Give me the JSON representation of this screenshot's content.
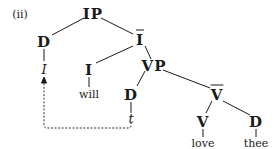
{
  "example_label": "(ii)",
  "nodes": {
    "ip": "IP",
    "d_spec": "D",
    "i_bar": "I",
    "pronoun_I": "I",
    "i_head": "I",
    "will": "will",
    "vp": "VP",
    "d_vp_spec": "D",
    "trace": "t",
    "v_bar": "V",
    "v_head": "V",
    "d_obj": "D",
    "love": "love",
    "thee": "thee"
  },
  "movement": {
    "from": "t",
    "to": "I",
    "style": "dashed-arrow"
  },
  "colors": {
    "ink": "#1a1a1a",
    "background": "#ffffff"
  }
}
